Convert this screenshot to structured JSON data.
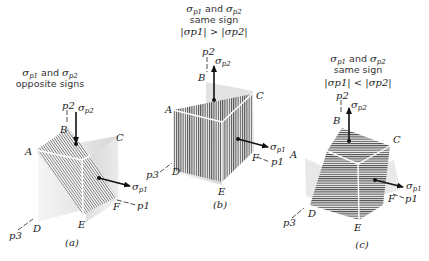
{
  "panels": [
    {
      "id": "a",
      "tag": "(a)",
      "caption_line1_sym1": "σ",
      "caption_line1_sub1": "p1",
      "caption_line1_and": "and",
      "caption_line1_sym2": "σ",
      "caption_line1_sub2": "p2",
      "caption_line2": "opposite signs",
      "caption_line3": "",
      "vertices": {
        "A": "A",
        "B": "B",
        "C": "C",
        "D": "D",
        "E": "E",
        "F": "F"
      },
      "axes": {
        "p1": "p1",
        "p2": "p2",
        "p3": "p3"
      },
      "stress_labels": {
        "s1": "σ",
        "s1_sub": "p1",
        "s2": "σ",
        "s2_sub": "p2"
      },
      "sigma_p2_direction": "compressive (down)",
      "hatch": "diagonal"
    },
    {
      "id": "b",
      "tag": "(b)",
      "caption_line1_sym1": "σ",
      "caption_line1_sub1": "p1",
      "caption_line1_and": "and",
      "caption_line1_sym2": "σ",
      "caption_line1_sub2": "p2",
      "caption_line2": "same sign",
      "caption_line3": "|σp1| > |σp2|",
      "vertices": {
        "A": "A",
        "B": "B",
        "C": "C",
        "D": "D",
        "E": "E",
        "F": "F"
      },
      "axes": {
        "p1": "p1",
        "p2": "p2",
        "p3": "p3"
      },
      "stress_labels": {
        "s1": "σ",
        "s1_sub": "p1",
        "s2": "σ",
        "s2_sub": "p2"
      },
      "sigma_p2_direction": "tensile (up)",
      "hatch": "vertical"
    },
    {
      "id": "c",
      "tag": "(c)",
      "caption_line1_sym1": "σ",
      "caption_line1_sub1": "p1",
      "caption_line1_and": "and",
      "caption_line1_sym2": "σ",
      "caption_line1_sub2": "p2",
      "caption_line2": "same sign",
      "caption_line3": "|σp1| < |σp2|",
      "vertices": {
        "A": "A",
        "B": "B",
        "C": "C",
        "D": "D",
        "E": "E",
        "F": "F"
      },
      "axes": {
        "p1": "p1",
        "p2": "p2",
        "p3": "p3"
      },
      "stress_labels": {
        "s1": "σ",
        "s1_sub": "p1",
        "s2": "σ",
        "s2_sub": "p2"
      },
      "sigma_p2_direction": "tensile (up)",
      "hatch": "horizontal"
    }
  ],
  "colors": {
    "hatch": "#555555",
    "shade": "#d4d4d4",
    "arrow": "#111111",
    "text": "#222222",
    "edge_highlight": "#ffffff"
  }
}
